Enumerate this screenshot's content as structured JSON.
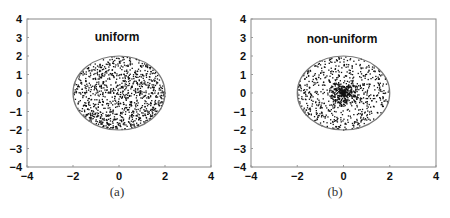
{
  "chart_data": [
    {
      "type": "scatter",
      "title": "uniform",
      "caption": "(a)",
      "xlabel": "",
      "ylabel": "",
      "xlim": [
        -4,
        4
      ],
      "ylim": [
        -4,
        4
      ],
      "xticks": [
        "-4",
        "-2",
        "0",
        "2",
        "4"
      ],
      "yticks": [
        "4",
        "3",
        "2",
        "1",
        "0",
        "-1",
        "-2",
        "-3",
        "-4"
      ],
      "grid": false,
      "circle": {
        "center": [
          0,
          0
        ],
        "radius": 2,
        "color": "#777777"
      },
      "distribution": "uniform within disk of radius 2",
      "approx_point_count": 1000,
      "point_color": "#111111"
    },
    {
      "type": "scatter",
      "title": "non-uniform",
      "caption": "(b)",
      "xlabel": "",
      "ylabel": "",
      "xlim": [
        -4,
        4
      ],
      "ylim": [
        -4,
        4
      ],
      "xticks": [
        "-4",
        "-2",
        "0",
        "2",
        "4"
      ],
      "yticks": [
        "4",
        "3",
        "2",
        "1",
        "0",
        "-1",
        "-2",
        "-3",
        "-4"
      ],
      "grid": false,
      "circle": {
        "center": [
          0,
          0
        ],
        "radius": 2,
        "color": "#777777"
      },
      "distribution": "non-uniform within disk of radius 2, concentrated near origin",
      "approx_point_count": 1000,
      "point_color": "#111111"
    }
  ],
  "panels": {
    "a": {
      "title": "uniform",
      "caption": "(a)"
    },
    "b": {
      "title": "non-uniform",
      "caption": "(b)"
    }
  },
  "ticks": {
    "x": [
      "−4",
      "−2",
      "0",
      "2",
      "4"
    ],
    "y": [
      "4",
      "3",
      "2",
      "1",
      "0",
      "−1",
      "−2",
      "−3",
      "−4"
    ]
  }
}
